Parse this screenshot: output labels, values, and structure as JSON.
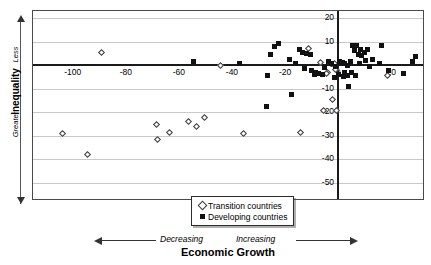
{
  "chart_data": {
    "type": "scatter",
    "title": "",
    "xlabel": "Economic Growth",
    "ylabel": "Inequality",
    "xlim": [
      -115,
      32
    ],
    "ylim": [
      -57,
      23
    ],
    "grid": true,
    "legend_position": "bottom-center",
    "xticks": [
      -100,
      -80,
      -60,
      -40,
      -20,
      0,
      20
    ],
    "yticks": [
      20,
      10,
      0,
      -10,
      -20,
      -30,
      -40,
      -50
    ],
    "xtick_labels": [
      "-100",
      "-80",
      "-60",
      "-40",
      "-20",
      "0",
      "20"
    ],
    "ytick_labels": [
      "20",
      "10",
      "0",
      "-10",
      "-20",
      "-30",
      "-40",
      "-50"
    ],
    "ylabel_direction_top": "Less",
    "ylabel_direction_bottom": "Greater",
    "xlabel_direction_left": "Decreasing",
    "xlabel_direction_right": "Increasing",
    "series": [
      {
        "name": "Transition countries",
        "marker": "open-diamond",
        "color": "#ffffff",
        "edge_color": "#3a3a3a",
        "points": [
          [
            -89.0,
            5.5
          ],
          [
            -44.5,
            0.0
          ],
          [
            -11.0,
            7.0
          ],
          [
            -6.5,
            1.0
          ],
          [
            -1.5,
            0.5
          ],
          [
            -4.0,
            -3.0
          ],
          [
            -4.5,
            -3.8
          ],
          [
            -1.0,
            -2.0
          ],
          [
            -2.0,
            -14.5
          ],
          [
            -0.5,
            -19.5
          ],
          [
            18.5,
            -4.5
          ],
          [
            -104.0,
            -29.0
          ],
          [
            -94.5,
            -38.0
          ],
          [
            -68.5,
            -25.5
          ],
          [
            -68.0,
            -31.5
          ],
          [
            -63.5,
            -28.5
          ],
          [
            -56.5,
            -24.0
          ],
          [
            -53.5,
            -26.0
          ],
          [
            -50.5,
            -22.5
          ],
          [
            -35.5,
            -29.0
          ],
          [
            -14.0,
            -28.5
          ],
          [
            -5.5,
            -19.5
          ]
        ]
      },
      {
        "name": "Developing countries",
        "marker": "filled-square",
        "color": "#111111",
        "points": [
          [
            -54.5,
            1.5
          ],
          [
            -37.0,
            0.5
          ],
          [
            -22.5,
            9.0
          ],
          [
            -25.5,
            4.5
          ],
          [
            -18.5,
            2.5
          ],
          [
            -14.5,
            6.5
          ],
          [
            -13.5,
            5.5
          ],
          [
            -12.0,
            5.0
          ],
          [
            -10.5,
            4.5
          ],
          [
            -12.5,
            -1.5
          ],
          [
            -10.0,
            -2.5
          ],
          [
            -8.5,
            -3.0
          ],
          [
            -7.5,
            -3.5
          ],
          [
            -9.0,
            -4.0
          ],
          [
            -6.0,
            -4.0
          ],
          [
            -3.5,
            1.5
          ],
          [
            -2.5,
            0.5
          ],
          [
            -1.0,
            -0.5
          ],
          [
            0.5,
            1.5
          ],
          [
            1.5,
            1.0
          ],
          [
            2.5,
            0.5
          ],
          [
            3.5,
            0.0
          ],
          [
            4.5,
            1.5
          ],
          [
            5.5,
            8.5
          ],
          [
            7.0,
            8.5
          ],
          [
            8.5,
            6.5
          ],
          [
            7.5,
            4.5
          ],
          [
            9.0,
            4.0
          ],
          [
            10.0,
            5.5
          ],
          [
            11.0,
            6.5
          ],
          [
            10.5,
            2.0
          ],
          [
            8.0,
            0.5
          ],
          [
            5.0,
            -3.0
          ],
          [
            3.5,
            -4.5
          ],
          [
            2.0,
            -5.0
          ],
          [
            6.5,
            -4.5
          ],
          [
            4.0,
            -9.0
          ],
          [
            16.5,
            8.5
          ],
          [
            15.5,
            0.5
          ],
          [
            19.0,
            -2.5
          ],
          [
            24.5,
            -3.5
          ],
          [
            28.0,
            1.5
          ],
          [
            29.0,
            3.5
          ],
          [
            -24.0,
            8.0
          ],
          [
            -26.5,
            -4.5
          ],
          [
            -27.0,
            -17.5
          ],
          [
            -17.5,
            -12.5
          ],
          [
            -1.5,
            -5.5
          ],
          [
            0.0,
            -4.0
          ],
          [
            2.5,
            -3.0
          ],
          [
            -5.0,
            -1.0
          ],
          [
            13.0,
            2.5
          ],
          [
            12.0,
            -0.5
          ],
          [
            6.0,
            6.0
          ],
          [
            -16.0,
            0.5
          ]
        ]
      }
    ]
  },
  "legend": {
    "items": [
      {
        "label": "Transition countries",
        "marker": "open-diamond"
      },
      {
        "label": "Developing countries",
        "marker": "filled-square"
      }
    ]
  },
  "axes": {
    "y_title": "Inequality",
    "y_dir_top": "Less",
    "y_dir_bottom": "Greater",
    "x_title": "Economic Growth",
    "x_dir_left": "Decreasing",
    "x_dir_right": "Increasing"
  }
}
